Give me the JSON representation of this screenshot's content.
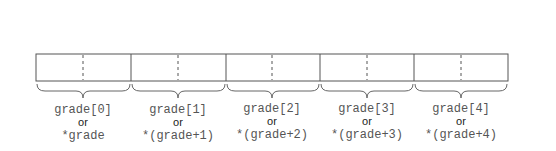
{
  "diagram": {
    "colors": {
      "line": "#555555",
      "text_mono": "#555555",
      "text_or": "#222222",
      "background": "#ffffff"
    },
    "cells": [
      {
        "index": 0,
        "subscript": "grade[0]",
        "or": "or",
        "pointer": "*grade"
      },
      {
        "index": 1,
        "subscript": "grade[1]",
        "or": "or",
        "pointer": "*(grade+1)"
      },
      {
        "index": 2,
        "subscript": "grade[2]",
        "or": "or",
        "pointer": "*(grade+2)"
      },
      {
        "index": 3,
        "subscript": "grade[3]",
        "or": "or",
        "pointer": "*(grade+3)"
      },
      {
        "index": 4,
        "subscript": "grade[4]",
        "or": "or",
        "pointer": "*(grade+4)"
      }
    ]
  }
}
